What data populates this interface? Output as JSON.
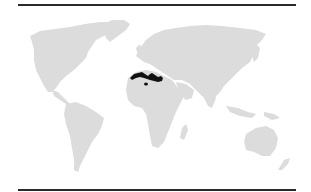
{
  "figure": {
    "type": "distribution-map",
    "projection": "world",
    "colors": {
      "land": "#dcdcdc",
      "range": "#111111",
      "rule": "#2a2a2a",
      "background": "#ffffff"
    },
    "highlighted_region": {
      "label": "North Africa (Mediterranean coast: Morocco, Algeria, Tunisia, Libya)",
      "shape": "band along northern coast of Africa with small outlying patch"
    }
  }
}
